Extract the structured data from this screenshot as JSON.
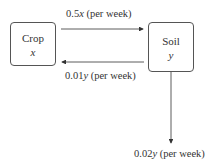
{
  "nodes": {
    "crop": {
      "name": "Crop",
      "variable": "x"
    },
    "soil": {
      "name": "Soil",
      "variable": "y"
    }
  },
  "flows": {
    "crop_to_soil": {
      "rate": "0.5",
      "var": "x",
      "unit": " (per week)"
    },
    "soil_to_crop": {
      "rate": "0.01",
      "var": "y",
      "unit": " (per week)"
    },
    "soil_out": {
      "rate": "0.02",
      "var": "y",
      "unit": " (per week)"
    }
  }
}
